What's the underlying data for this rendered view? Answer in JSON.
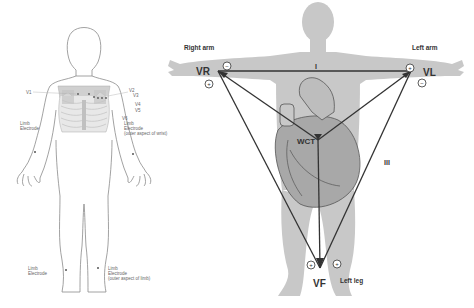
{
  "left_figure": {
    "title": "Electrode placement",
    "chest_labels": {
      "v1": "V1",
      "v2": "V2",
      "v3": "V3",
      "v4": "V4",
      "v5": "V5",
      "v6": "V6"
    },
    "right_arm_label_1": "Limb",
    "right_arm_label_2": "Electrode",
    "left_arm_label_1": "Limb",
    "left_arm_label_2": "Electrode",
    "left_arm_label_3": "(outer aspect of wrist)",
    "right_leg_label_1": "Limb",
    "right_leg_label_2": "Electrode",
    "left_leg_label_1": "Limb",
    "left_leg_label_2": "Electrode",
    "left_leg_label_3": "(outer aspect of limb)"
  },
  "right_figure": {
    "right_arm": "Right arm",
    "left_arm": "Left arm",
    "left_leg": "Left leg",
    "vr": "VR",
    "vl": "VL",
    "vf": "VF",
    "wct": "WCT",
    "lead_i": "I",
    "lead_iii": "III",
    "plus": "+",
    "minus": "−"
  },
  "colors": {
    "body_fill": "#c8c8c8",
    "line": "#333333",
    "outline": "#777777",
    "heart": "#a9a9a9"
  }
}
